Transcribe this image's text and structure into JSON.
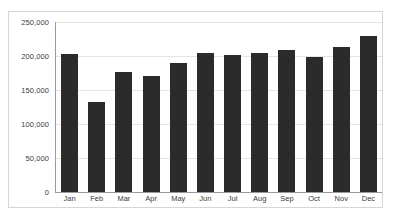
{
  "chart_data": {
    "type": "bar",
    "title": "",
    "subtitle": "",
    "xlabel": "",
    "ylabel": "",
    "categories": [
      "Jan",
      "Feb",
      "Mar",
      "Apr",
      "May",
      "Jun",
      "Jul",
      "Aug",
      "Sep",
      "Oct",
      "Nov",
      "Dec"
    ],
    "values": [
      203000,
      133000,
      177000,
      170000,
      190000,
      204000,
      201000,
      205000,
      209000,
      198000,
      213000,
      229000
    ],
    "ylim": [
      0,
      250000
    ],
    "y_ticks": [
      0,
      50000,
      100000,
      150000,
      200000,
      250000
    ],
    "y_tick_labels": [
      "0",
      "50,000",
      "100,000",
      "150,000",
      "200,000",
      "250,000"
    ],
    "grid": true,
    "legend": false,
    "legend_position": "none",
    "bar_color": "#2b2b2b",
    "gridline_color": "#e4e4e4",
    "axis_color": "#9a9a9a",
    "frame_color": "#d6d6d6",
    "background_color": "#ffffff"
  }
}
